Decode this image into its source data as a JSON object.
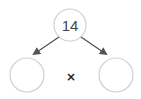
{
  "diagram": {
    "type": "factor-tree",
    "root": {
      "value": "14"
    },
    "children": [
      {
        "value": ""
      },
      {
        "value": ""
      }
    ],
    "operator": "×",
    "colors": {
      "circle_stroke": "#d0d0d0",
      "arrow": "#555555",
      "text": "#444444"
    }
  }
}
